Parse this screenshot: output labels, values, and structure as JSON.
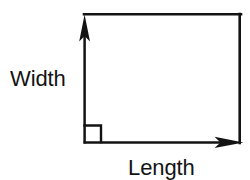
{
  "diagram": {
    "type": "rectangle-dimension-diagram",
    "background_color": "#ffffff",
    "stroke_color": "#131313",
    "labels": {
      "width": "Width",
      "length": "Length"
    },
    "rectangle": {
      "left": 84,
      "top": 14,
      "right": 241,
      "bottom": 143,
      "stroke_width": 2.6
    },
    "width_arrow": {
      "orientation": "vertical",
      "direction": "up",
      "x": 84.5,
      "from_y": 143,
      "to_y": 15,
      "arrowhead_length": 26,
      "arrowhead_half_width": 5.5
    },
    "length_arrow": {
      "orientation": "horizontal",
      "direction": "right",
      "y": 143,
      "from_x": 84,
      "to_x": 243,
      "arrowhead_length": 29,
      "arrowhead_half_width": 5.5
    },
    "right_angle_marker": {
      "corner": "bottom-left",
      "x": 84,
      "y": 125,
      "size": 17,
      "stroke_width": 2.4
    },
    "width_label_position": {
      "x": 10,
      "y": 86
    },
    "length_label_position": {
      "x": 128,
      "y": 175
    }
  }
}
